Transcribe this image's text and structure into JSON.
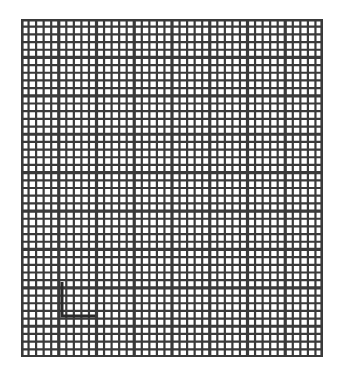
{
  "grid": {
    "left": 21,
    "top": 19,
    "width": 302,
    "height": 338,
    "cols": 40,
    "rows": 44,
    "major_every": 5,
    "line_color": "#3a3a3a",
    "minor_width": 2.2,
    "major_width": 3.2,
    "background": "#ffffff"
  },
  "marker": {
    "shape": "L",
    "points": [
      [
        62,
        282
      ],
      [
        62,
        316
      ],
      [
        95,
        316
      ]
    ],
    "color": "#2a2a2a",
    "width": 3
  }
}
